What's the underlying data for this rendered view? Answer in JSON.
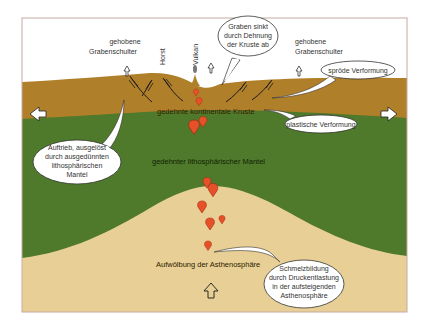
{
  "diagram": {
    "colors": {
      "sky": "#ffffff",
      "crust": "#b07f2a",
      "mantle": "#4f7a2b",
      "asthenosphere": "#e8cf95",
      "melt": "#e8502a",
      "frame": "#c9a9a0"
    },
    "labels": {
      "shoulder_left_1": "gehobene",
      "shoulder_left_2": "Grabenschulter",
      "horst": "Horst",
      "vulkan": "Vulkan",
      "shoulder_right_1": "gehobene",
      "shoulder_right_2": "Grabenschulter",
      "crust": "gedehnte kontinentale Kruste",
      "mantle": "gedehnter lithosphärischer Mantel",
      "asthenosphere": "Aufwölbung der Asthenosphäre"
    },
    "callouts": {
      "graben": [
        "Graben sinkt",
        "durch Dehnung",
        "der Kruste ab"
      ],
      "sproede": "spröde Verformung",
      "plastisch": "plastische Verformung",
      "auftrieb": [
        "Auftrieb, ausgelöst",
        "durch ausgedünnten",
        "lithosphärischen",
        "Mantel"
      ],
      "schmelz": [
        "Schmelzbildung",
        "durch Druckentlastung",
        "in der aufsteigenden",
        "Asthenosphäre"
      ]
    },
    "arrows": {
      "left": "extension-left",
      "right": "extension-right",
      "up": "upwelling"
    }
  }
}
